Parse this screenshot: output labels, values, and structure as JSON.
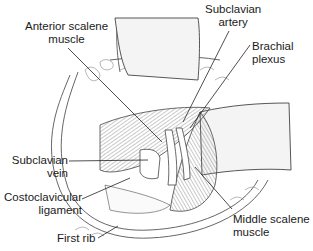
{
  "figure": {
    "type": "anatomical-illustration",
    "colors": {
      "line": "#3a3a3a",
      "shade": "#8a8a8a",
      "background": "#ffffff",
      "retractor": "#f4f4f4"
    }
  },
  "labels": {
    "anterior_scalene": {
      "line1": "Anterior scalene",
      "line2": "muscle"
    },
    "subclavian_artery": {
      "line1": "Subclavian",
      "line2": "artery"
    },
    "brachial_plexus": {
      "line1": "Brachial",
      "line2": "plexus"
    },
    "subclavian_vein": {
      "line1": "Subclavian",
      "line2": "vein"
    },
    "costoclavicular_ligament": {
      "line1": "Costoclavicular",
      "line2": "ligament"
    },
    "first_rib": {
      "line1": "First rib"
    },
    "middle_scalene": {
      "line1": "Middle scalene",
      "line2": "muscle"
    }
  }
}
